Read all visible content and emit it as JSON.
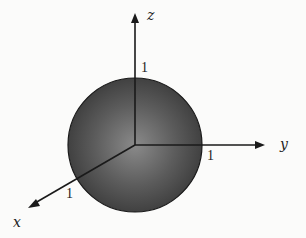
{
  "diagram": {
    "title": "",
    "axes": {
      "x": {
        "label": "x",
        "tick": "1"
      },
      "y": {
        "label": "y",
        "tick": "1"
      },
      "z": {
        "label": "z",
        "tick": "1"
      }
    },
    "sphere": {
      "radius_label": "1",
      "fill_center": "#8a8a8a",
      "fill_edge": "#3a3a3a",
      "stroke": "#1a1a1a"
    },
    "colors": {
      "background": "#fbfbfa",
      "axis": "#1a1a1a"
    }
  }
}
